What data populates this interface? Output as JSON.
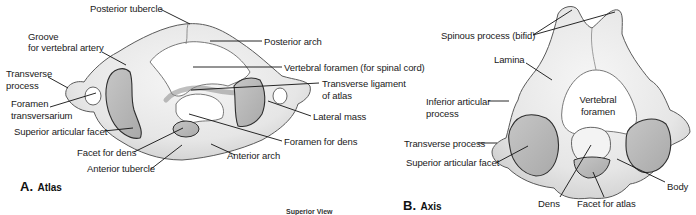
{
  "colors": {
    "bone": "#ececec",
    "bone_shadow": "#d2d2d2",
    "facet": "#b9b9b9",
    "outline": "#3a3a3a",
    "leader": "#111111",
    "text": "#1a1a1a"
  },
  "atlas": {
    "panel_letter": "A.",
    "panel_name": "Atlas",
    "labels": {
      "posterior_tubercle": "Posterior tubercle",
      "groove_line1": "Groove",
      "groove_line2": "for vertebral artery",
      "posterior_arch": "Posterior arch",
      "transverse_process_line1": "Transverse",
      "transverse_process_line2": "process",
      "vertebral_foramen": "Vertebral foramen (for spinal cord)",
      "transverse_ligament_line1": "Transverse ligament",
      "transverse_ligament_line2": "of atlas",
      "foramen_transversarium_line1": "Foramen",
      "foramen_transversarium_line2": "transversarium",
      "lateral_mass": "Lateral mass",
      "superior_articular_facet": "Superior articular facet",
      "foramen_for_dens": "Foramen for dens",
      "facet_for_dens": "Facet for dens",
      "anterior_arch": "Anterior arch",
      "anterior_tubercle": "Anterior tubercle"
    }
  },
  "axis": {
    "panel_letter": "B.",
    "panel_name": "Axis",
    "labels": {
      "spinous_process": "Spinous process (bifid)",
      "lamina": "Lamina",
      "inferior_articular_line1": "Inferior articular",
      "inferior_articular_line2": "process",
      "vertebral_foramen_line1": "Vertebral",
      "vertebral_foramen_line2": "foramen",
      "transverse_process": "Transverse process",
      "superior_articular_facet": "Superior articular facet",
      "dens": "Dens",
      "facet_for_atlas": "Facet for atlas",
      "body": "Body"
    }
  },
  "footer": "Superior View"
}
